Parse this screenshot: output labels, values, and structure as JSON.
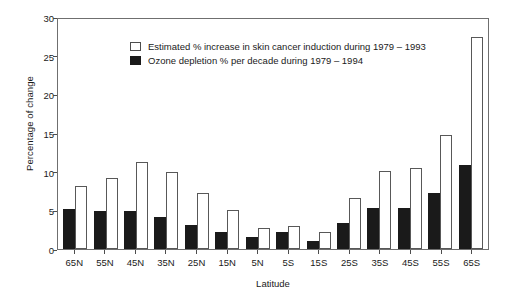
{
  "chart_data": {
    "type": "bar",
    "title": "",
    "xlabel": "Latitude",
    "ylabel": "Percentage of change",
    "ylim": [
      0,
      30
    ],
    "yticks": [
      0,
      5,
      10,
      15,
      20,
      25,
      30
    ],
    "grid": false,
    "legend_position": "top-left inside",
    "categories": [
      "65N",
      "55N",
      "45N",
      "35N",
      "25N",
      "15N",
      "5N",
      "5S",
      "15S",
      "25S",
      "35S",
      "45S",
      "55S",
      "65S"
    ],
    "series": [
      {
        "name": "Estimated % increase in skin cancer induction during 1979 – 1993",
        "color": "#ffffff",
        "edge_color": "#585858",
        "values": [
          8.2,
          9.2,
          11.3,
          10.0,
          7.3,
          5.0,
          2.7,
          3.0,
          2.2,
          6.6,
          10.1,
          10.5,
          14.7,
          27.4
        ]
      },
      {
        "name": "Ozone depletion % per decade during 1979 – 1994",
        "color": "#1a1a1a",
        "edge_color": "#1a1a1a",
        "values": [
          5.2,
          4.9,
          4.9,
          4.1,
          3.1,
          2.2,
          1.6,
          2.2,
          1.0,
          3.4,
          5.3,
          5.3,
          7.3,
          10.9
        ]
      }
    ]
  }
}
